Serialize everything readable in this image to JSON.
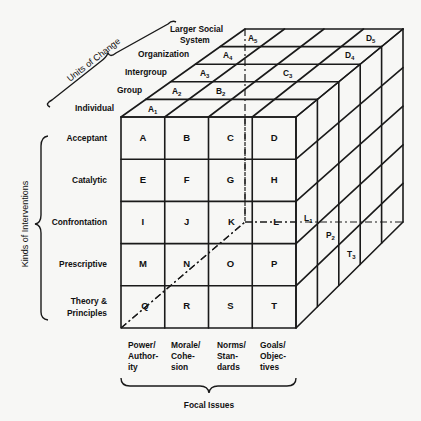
{
  "diagram": {
    "axes": {
      "units_of_change": {
        "title": "Units of Change",
        "levels": [
          "Individual",
          "Group",
          "Intergroup",
          "Organization",
          "Larger Social",
          "System"
        ]
      },
      "kinds_of_interventions": {
        "title": "Kinds of Interventions",
        "rows": [
          "Acceptant",
          "Catalytic",
          "Confrontation",
          "Prescriptive",
          "Theory &",
          "Principles"
        ]
      },
      "focal_issues": {
        "title": "Focal Issues",
        "columns": [
          [
            "Power/",
            "Author-",
            "ity"
          ],
          [
            "Morale/",
            "Cohe-",
            "sion"
          ],
          [
            "Norms/",
            "Stan-",
            "dards"
          ],
          [
            "Goals/",
            "Objec-",
            "tives"
          ]
        ]
      }
    },
    "front_cells": [
      "A",
      "B",
      "C",
      "D",
      "E",
      "F",
      "G",
      "H",
      "I",
      "J",
      "K",
      "L",
      "M",
      "N",
      "O",
      "P",
      "Q",
      "R",
      "S",
      "T"
    ],
    "top_face_labels": [
      {
        "letter": "A",
        "sub": "1"
      },
      {
        "letter": "A",
        "sub": "2"
      },
      {
        "letter": "B",
        "sub": "2"
      },
      {
        "letter": "A",
        "sub": "3"
      },
      {
        "letter": "C",
        "sub": "3"
      },
      {
        "letter": "A",
        "sub": "4"
      },
      {
        "letter": "D",
        "sub": "4"
      },
      {
        "letter": "A",
        "sub": "5"
      },
      {
        "letter": "D",
        "sub": "5"
      }
    ],
    "side_face_labels": [
      {
        "letter": "L",
        "sub": "1"
      },
      {
        "letter": "P",
        "sub": "2"
      },
      {
        "letter": "T",
        "sub": "3"
      }
    ]
  }
}
